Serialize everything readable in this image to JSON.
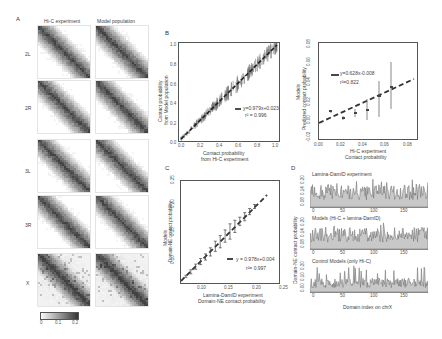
{
  "panelA": {
    "letter": "A",
    "col_headers": [
      "Hi-C experiment",
      "Model population"
    ],
    "rows": [
      "2L",
      "2R",
      "3L",
      "3R",
      "X"
    ],
    "colorbar": {
      "ticks": [
        "0",
        "0.1",
        "0.2"
      ],
      "min": 0,
      "max": 0.2
    }
  },
  "panelB": {
    "letter": "B",
    "ylabel_1": "Contact probability",
    "ylabel_2": "from Model population",
    "xlabel_1": "Contact probability",
    "xlabel_2": "from Hi-C experiment",
    "xticks": [
      "0.0",
      "0.2",
      "0.4",
      "0.6",
      "0.8",
      "1.0"
    ],
    "yticks": [
      "0.0",
      "0.2",
      "0.4",
      "0.6",
      "0.8",
      "1.0"
    ],
    "equation": "y=0.979x+0.023",
    "r2": "r² = 0.996"
  },
  "panelB2": {
    "ylabel_1": "Models",
    "ylabel_2": "Predicted contact probability",
    "xlabel_1": "Hi-C experiment",
    "xlabel_2": "Contact probability",
    "xticks": [
      "0.00",
      "0.02",
      "0.04",
      "0.06",
      "0.08"
    ],
    "yticks": [
      "-0.02",
      "0.00",
      "0.02",
      "0.04",
      "0.06",
      "0.08"
    ],
    "equation": "y=0.628x-0.008",
    "r2": "r²=0.822"
  },
  "panelC": {
    "letter": "C",
    "ylabel_1": "Models",
    "ylabel_2": "Domain-NE contact probability",
    "xlabel_1": "Lamina-DamID experiment",
    "xlabel_2": "Domain-NE contact probability",
    "xticks": [
      "0.10",
      "0.15",
      "0.20",
      "0.25"
    ],
    "yticks": [
      "0.10",
      "0.15",
      "0.20",
      "0.25"
    ],
    "equation": "y = 0.978x+0.004",
    "r2": "r²= 0.997"
  },
  "panelD": {
    "letter": "D",
    "ylabel": "Domain-NE contact probability",
    "xlabel": "Domain index on chrX",
    "xticks": [
      "0",
      "50",
      "100",
      "150"
    ],
    "subplots": [
      {
        "title": "Lamina-DamID experiment",
        "yticks": [
          "0.08",
          "0.14",
          "0.20"
        ]
      },
      {
        "title": "Models (Hi-C + lamina-DamID)",
        "yticks": [
          "0.08",
          "0.14",
          "0.20"
        ]
      },
      {
        "title": "Control Models (only Hi-C)",
        "yticks": [
          "0.00",
          "0.10",
          "0.20"
        ]
      }
    ]
  },
  "chart_data": [
    {
      "type": "heatmap",
      "title": "A: Hi-C experiment vs Model population contact maps",
      "rows": [
        "2L",
        "2R",
        "3L",
        "3R",
        "X"
      ],
      "columns": [
        "Hi-C experiment",
        "Model population"
      ],
      "colorbar": {
        "min": 0,
        "max": 0.2,
        "ticks": [
          0,
          0.1,
          0.2
        ]
      }
    },
    {
      "type": "scatter",
      "title": "B (left)",
      "xlabel": "Contact probability from Hi-C experiment",
      "ylabel": "Contact probability from Model population",
      "xlim": [
        0,
        1.0
      ],
      "ylim": [
        0,
        1.0
      ],
      "fit": {
        "slope": 0.979,
        "intercept": 0.023,
        "r2": 0.996
      },
      "x": [
        0.0,
        0.1,
        0.2,
        0.3,
        0.4,
        0.5,
        0.6,
        0.7,
        0.8,
        0.9,
        1.0
      ],
      "y": [
        0.02,
        0.12,
        0.22,
        0.32,
        0.42,
        0.51,
        0.61,
        0.71,
        0.81,
        0.9,
        1.0
      ]
    },
    {
      "type": "scatter",
      "title": "B (right)",
      "xlabel": "Hi-C experiment Contact probability",
      "ylabel": "Models Predicted contact probability",
      "xlim": [
        0,
        0.08
      ],
      "ylim": [
        -0.02,
        0.08
      ],
      "fit": {
        "slope": 0.628,
        "intercept": -0.008,
        "r2": 0.822
      },
      "x": [
        0.0,
        0.01,
        0.02,
        0.03,
        0.04,
        0.05,
        0.06
      ],
      "y": [
        0.0,
        -0.002,
        0.003,
        0.008,
        0.011,
        0.026,
        0.033
      ],
      "err": [
        0.001,
        0.002,
        0.003,
        0.006,
        0.015,
        0.02,
        0.025
      ]
    },
    {
      "type": "scatter",
      "title": "C",
      "xlabel": "Lamina-DamID experiment Domain-NE contact probability",
      "ylabel": "Models Domain-NE contact probability",
      "xlim": [
        0.06,
        0.26
      ],
      "ylim": [
        0.06,
        0.26
      ],
      "fit": {
        "slope": 0.978,
        "intercept": 0.004,
        "r2": 0.997
      },
      "x": [
        0.07,
        0.08,
        0.09,
        0.1,
        0.11,
        0.12,
        0.13,
        0.14,
        0.15,
        0.16,
        0.17,
        0.18,
        0.19,
        0.2,
        0.21
      ],
      "y": [
        0.073,
        0.082,
        0.092,
        0.102,
        0.111,
        0.121,
        0.132,
        0.141,
        0.152,
        0.161,
        0.171,
        0.181,
        0.19,
        0.2,
        0.21
      ],
      "err": [
        0.002,
        0.004,
        0.005,
        0.006,
        0.006,
        0.008,
        0.01,
        0.012,
        0.012,
        0.015,
        0.012,
        0.008,
        0.008,
        0.006,
        0.004
      ]
    },
    {
      "type": "area",
      "title": "D",
      "xlabel": "Domain index on chrX",
      "ylabel": "Domain-NE contact probability",
      "xlim": [
        0,
        180
      ],
      "series": [
        {
          "name": "Lamina-DamID experiment",
          "ylim": [
            0.06,
            0.22
          ]
        },
        {
          "name": "Models (Hi-C + lamina-DamID)",
          "ylim": [
            0.06,
            0.22
          ]
        },
        {
          "name": "Control Models (only Hi-C)",
          "ylim": [
            0.0,
            0.22
          ]
        }
      ]
    }
  ]
}
